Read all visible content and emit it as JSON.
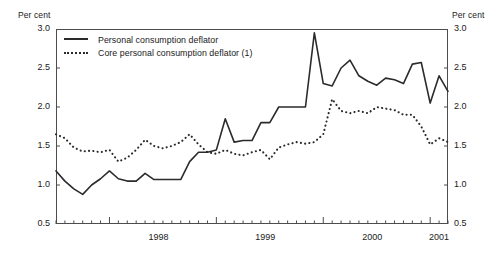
{
  "axes": {
    "unit_left": "Per cent",
    "unit_right": "Per cent",
    "y_ticks": [
      "0.5",
      "1.0",
      "1.5",
      "2.0",
      "2.5",
      "3.0"
    ],
    "x_ticks": [
      "1998",
      "1999",
      "2000",
      "2001"
    ]
  },
  "legend": {
    "items": [
      {
        "label": "Personal consumption deflator",
        "style": "solid"
      },
      {
        "label": "Core personal consumption deflator (1)",
        "style": "dotted"
      }
    ]
  },
  "colors": {
    "line": "#2b2b2b",
    "frame": "#4d4d4d",
    "background": "#ffffff"
  },
  "chart_data": {
    "type": "line",
    "title": "",
    "xlabel": "",
    "ylabel": "Per cent",
    "ylim": [
      0.5,
      3.0
    ],
    "ytick_values": [
      0.5,
      1.0,
      1.5,
      2.0,
      2.5,
      3.0
    ],
    "grid": false,
    "legend_position": "top-left",
    "x_axis_type": "monthly time series",
    "x_start": "1997-07",
    "x_end": "2001-03",
    "x_major_tick_labels": [
      "1998",
      "1999",
      "2000",
      "2001"
    ],
    "x_minor_tick_interval": "1 month",
    "x": [
      "1997-07",
      "1997-08",
      "1997-09",
      "1997-10",
      "1997-11",
      "1997-12",
      "1998-01",
      "1998-02",
      "1998-03",
      "1998-04",
      "1998-05",
      "1998-06",
      "1998-07",
      "1998-08",
      "1998-09",
      "1998-10",
      "1998-11",
      "1998-12",
      "1999-01",
      "1999-02",
      "1999-03",
      "1999-04",
      "1999-05",
      "1999-06",
      "1999-07",
      "1999-08",
      "1999-09",
      "1999-10",
      "1999-11",
      "1999-12",
      "2000-01",
      "2000-02",
      "2000-03",
      "2000-04",
      "2000-05",
      "2000-06",
      "2000-07",
      "2000-08",
      "2000-09",
      "2000-10",
      "2000-11",
      "2000-12",
      "2001-01",
      "2001-02",
      "2001-03"
    ],
    "series": [
      {
        "name": "Personal consumption deflator",
        "style": "solid",
        "values": [
          1.18,
          1.05,
          0.95,
          0.88,
          1.0,
          1.08,
          1.18,
          1.08,
          1.05,
          1.05,
          1.15,
          1.07,
          1.07,
          1.07,
          1.07,
          1.3,
          1.42,
          1.42,
          1.45,
          1.85,
          1.55,
          1.57,
          1.57,
          1.8,
          1.8,
          2.0,
          2.0,
          2.0,
          2.0,
          2.95,
          2.3,
          2.27,
          2.5,
          2.6,
          2.4,
          2.33,
          2.28,
          2.37,
          2.35,
          2.3,
          2.55,
          2.57,
          2.05,
          2.4,
          2.2
        ]
      },
      {
        "name": "Core personal consumption deflator (1)",
        "style": "dotted",
        "values": [
          1.65,
          1.6,
          1.48,
          1.43,
          1.44,
          1.42,
          1.45,
          1.3,
          1.35,
          1.45,
          1.58,
          1.5,
          1.47,
          1.5,
          1.55,
          1.65,
          1.52,
          1.42,
          1.4,
          1.45,
          1.4,
          1.38,
          1.42,
          1.45,
          1.33,
          1.48,
          1.52,
          1.55,
          1.53,
          1.55,
          1.65,
          2.1,
          1.95,
          1.92,
          1.95,
          1.92,
          2.0,
          1.98,
          1.96,
          1.9,
          1.9,
          1.75,
          1.52,
          1.6,
          1.55
        ]
      }
    ]
  }
}
